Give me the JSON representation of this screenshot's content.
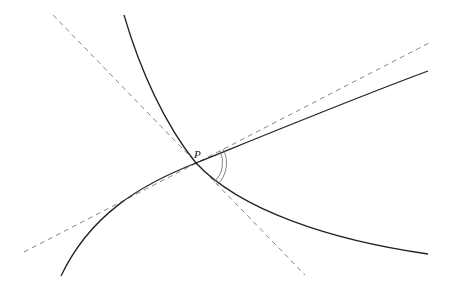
{
  "diagram": {
    "point": {
      "label": "P",
      "x": 196,
      "y": 163
    },
    "curves": [
      {
        "name": "curve-1",
        "description": "descends from top, passes P, flattens to the lower right"
      },
      {
        "name": "curve-2",
        "description": "rises from lower left, passes P, continues to the upper right"
      }
    ],
    "tangents": [
      {
        "name": "tangent-1",
        "style": "dashed",
        "description": "tangent to curve-1 at P"
      },
      {
        "name": "tangent-2",
        "style": "dashed",
        "description": "tangent to curve-2 at P"
      }
    ],
    "angle_marker": {
      "style": "double arc",
      "between": [
        "tangent-2",
        "tangent-1"
      ]
    },
    "colors": {
      "curve": "#222222",
      "tangent": "#777777",
      "background": "#ffffff"
    }
  }
}
